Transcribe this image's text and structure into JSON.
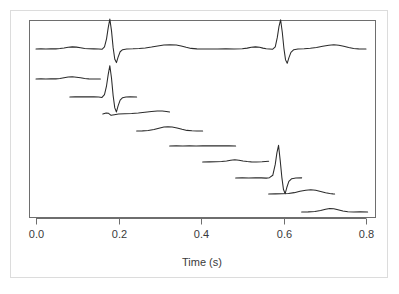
{
  "figure": {
    "background_color": "#ffffff",
    "outer_border_color": "#dcdcdc",
    "frame_color": "#6e6e6e",
    "trace_color": "#2b2b2b"
  },
  "chart_data": {
    "type": "line",
    "title": "",
    "subtitle": "",
    "xlabel": "Time (s)",
    "ylabel": "",
    "xlim": [
      -0.012,
      0.824
    ],
    "ylim": [
      0,
      1
    ],
    "grid": false,
    "legend": null,
    "xticks": [
      0.0,
      0.2,
      0.4,
      0.6,
      0.8
    ],
    "xticklabels": [
      "0.0",
      "0.2",
      "0.4",
      "0.6",
      "0.8"
    ],
    "yticks": [],
    "yticklabels": [],
    "series": [
      {
        "name": "full-ecg-strip",
        "row": 0,
        "x_start": 0.0,
        "x_end": 0.8,
        "baseline_y_px": 49,
        "points": [
          [
            0.0,
            0.0
          ],
          [
            0.012,
            0.004
          ],
          [
            0.024,
            0.002
          ],
          [
            0.036,
            0.006
          ],
          [
            0.048,
            0.004
          ],
          [
            0.058,
            0.012
          ],
          [
            0.068,
            0.03
          ],
          [
            0.078,
            0.052
          ],
          [
            0.088,
            0.062
          ],
          [
            0.098,
            0.055
          ],
          [
            0.108,
            0.036
          ],
          [
            0.118,
            0.016
          ],
          [
            0.128,
            0.006
          ],
          [
            0.14,
            0.004
          ],
          [
            0.152,
            0.0
          ],
          [
            0.16,
            -0.008
          ],
          [
            0.166,
            0.06
          ],
          [
            0.171,
            0.3
          ],
          [
            0.175,
            0.62
          ],
          [
            0.179,
            0.88
          ],
          [
            0.183,
            0.54
          ],
          [
            0.187,
            0.04
          ],
          [
            0.191,
            -0.3
          ],
          [
            0.195,
            -0.4
          ],
          [
            0.199,
            -0.24
          ],
          [
            0.204,
            -0.08
          ],
          [
            0.21,
            -0.02
          ],
          [
            0.22,
            0.0
          ],
          [
            0.235,
            0.006
          ],
          [
            0.25,
            0.016
          ],
          [
            0.265,
            0.03
          ],
          [
            0.28,
            0.056
          ],
          [
            0.295,
            0.088
          ],
          [
            0.31,
            0.115
          ],
          [
            0.325,
            0.126
          ],
          [
            0.34,
            0.118
          ],
          [
            0.352,
            0.09
          ],
          [
            0.364,
            0.05
          ],
          [
            0.376,
            0.018
          ],
          [
            0.39,
            0.004
          ],
          [
            0.405,
            0.0
          ],
          [
            0.42,
            0.002
          ],
          [
            0.44,
            0.0
          ],
          [
            0.46,
            0.004
          ],
          [
            0.48,
            0.002
          ],
          [
            0.5,
            0.008
          ],
          [
            0.512,
            0.026
          ],
          [
            0.522,
            0.05
          ],
          [
            0.532,
            0.062
          ],
          [
            0.542,
            0.05
          ],
          [
            0.55,
            0.026
          ],
          [
            0.558,
            0.008
          ],
          [
            0.566,
            0.0
          ],
          [
            0.574,
            -0.006
          ],
          [
            0.58,
            0.06
          ],
          [
            0.585,
            0.34
          ],
          [
            0.589,
            0.66
          ],
          [
            0.593,
            0.86
          ],
          [
            0.597,
            0.5
          ],
          [
            0.601,
            0.02
          ],
          [
            0.605,
            -0.32
          ],
          [
            0.609,
            -0.42
          ],
          [
            0.613,
            -0.26
          ],
          [
            0.618,
            -0.1
          ],
          [
            0.625,
            -0.02
          ],
          [
            0.635,
            0.0
          ],
          [
            0.65,
            0.006
          ],
          [
            0.665,
            0.02
          ],
          [
            0.68,
            0.045
          ],
          [
            0.695,
            0.08
          ],
          [
            0.71,
            0.11
          ],
          [
            0.722,
            0.122
          ],
          [
            0.734,
            0.112
          ],
          [
            0.746,
            0.082
          ],
          [
            0.758,
            0.042
          ],
          [
            0.77,
            0.014
          ],
          [
            0.782,
            0.004
          ],
          [
            0.792,
            0.002
          ],
          [
            0.8,
            0.0
          ]
        ]
      },
      {
        "name": "beat-segment-1",
        "row": 1,
        "x_start": 0.0,
        "x_end": 0.156,
        "baseline_y_px": 79,
        "points": [
          [
            0.0,
            0.0
          ],
          [
            0.012,
            0.004
          ],
          [
            0.024,
            0.0
          ],
          [
            0.036,
            0.006
          ],
          [
            0.048,
            0.004
          ],
          [
            0.058,
            0.014
          ],
          [
            0.068,
            0.034
          ],
          [
            0.078,
            0.056
          ],
          [
            0.088,
            0.064
          ],
          [
            0.098,
            0.054
          ],
          [
            0.108,
            0.034
          ],
          [
            0.118,
            0.014
          ],
          [
            0.128,
            0.004
          ],
          [
            0.14,
            0.002
          ],
          [
            0.156,
            0.0
          ]
        ]
      },
      {
        "name": "beat-segment-2",
        "row": 2,
        "x_start": 0.082,
        "x_end": 0.244,
        "baseline_y_px": 97,
        "points": [
          [
            0.082,
            0.0
          ],
          [
            0.095,
            0.006
          ],
          [
            0.11,
            0.004
          ],
          [
            0.125,
            0.008
          ],
          [
            0.14,
            0.004
          ],
          [
            0.152,
            0.0
          ],
          [
            0.16,
            -0.012
          ],
          [
            0.166,
            0.07
          ],
          [
            0.171,
            0.33
          ],
          [
            0.175,
            0.66
          ],
          [
            0.179,
            0.92
          ],
          [
            0.183,
            0.56
          ],
          [
            0.187,
            0.04
          ],
          [
            0.191,
            -0.32
          ],
          [
            0.195,
            -0.44
          ],
          [
            0.199,
            -0.26
          ],
          [
            0.204,
            -0.09
          ],
          [
            0.21,
            -0.02
          ],
          [
            0.218,
            0.0
          ],
          [
            0.228,
            0.004
          ],
          [
            0.244,
            0.002
          ]
        ]
      },
      {
        "name": "beat-segment-3",
        "row": 3,
        "x_start": 0.162,
        "x_end": 0.324,
        "baseline_y_px": 114,
        "points": [
          [
            0.162,
            0.0
          ],
          [
            0.17,
            0.03
          ],
          [
            0.176,
            0.02
          ],
          [
            0.182,
            -0.04
          ],
          [
            0.19,
            -0.02
          ],
          [
            0.2,
            0.0
          ],
          [
            0.215,
            0.006
          ],
          [
            0.232,
            0.016
          ],
          [
            0.248,
            0.03
          ],
          [
            0.264,
            0.05
          ],
          [
            0.28,
            0.072
          ],
          [
            0.294,
            0.086
          ],
          [
            0.306,
            0.086
          ],
          [
            0.316,
            0.072
          ],
          [
            0.324,
            0.058
          ]
        ]
      },
      {
        "name": "beat-segment-4",
        "row": 4,
        "x_start": 0.244,
        "x_end": 0.404,
        "baseline_y_px": 131,
        "points": [
          [
            0.244,
            0.0
          ],
          [
            0.258,
            0.004
          ],
          [
            0.272,
            0.014
          ],
          [
            0.286,
            0.042
          ],
          [
            0.298,
            0.082
          ],
          [
            0.31,
            0.115
          ],
          [
            0.32,
            0.126
          ],
          [
            0.33,
            0.118
          ],
          [
            0.342,
            0.09
          ],
          [
            0.354,
            0.05
          ],
          [
            0.366,
            0.018
          ],
          [
            0.378,
            0.006
          ],
          [
            0.39,
            0.002
          ],
          [
            0.404,
            0.0
          ]
        ]
      },
      {
        "name": "beat-segment-5",
        "row": 5,
        "x_start": 0.324,
        "x_end": 0.484,
        "baseline_y_px": 146,
        "points": [
          [
            0.324,
            0.0
          ],
          [
            0.34,
            0.004
          ],
          [
            0.356,
            0.002
          ],
          [
            0.372,
            0.006
          ],
          [
            0.388,
            0.002
          ],
          [
            0.404,
            0.006
          ],
          [
            0.42,
            0.004
          ],
          [
            0.436,
            0.008
          ],
          [
            0.452,
            0.004
          ],
          [
            0.468,
            0.006
          ],
          [
            0.484,
            0.002
          ]
        ]
      },
      {
        "name": "beat-segment-6",
        "row": 6,
        "x_start": 0.404,
        "x_end": 0.564,
        "baseline_y_px": 162,
        "points": [
          [
            0.404,
            0.0
          ],
          [
            0.42,
            0.004
          ],
          [
            0.436,
            0.006
          ],
          [
            0.45,
            0.012
          ],
          [
            0.462,
            0.03
          ],
          [
            0.472,
            0.054
          ],
          [
            0.482,
            0.066
          ],
          [
            0.492,
            0.054
          ],
          [
            0.502,
            0.03
          ],
          [
            0.512,
            0.012
          ],
          [
            0.522,
            0.004
          ],
          [
            0.534,
            0.0
          ],
          [
            0.548,
            0.006
          ],
          [
            0.556,
            0.012
          ],
          [
            0.564,
            0.02
          ]
        ]
      },
      {
        "name": "beat-segment-7",
        "row": 7,
        "x_start": 0.484,
        "x_end": 0.644,
        "baseline_y_px": 178,
        "points": [
          [
            0.484,
            0.0
          ],
          [
            0.5,
            0.004
          ],
          [
            0.516,
            0.002
          ],
          [
            0.532,
            0.006
          ],
          [
            0.546,
            0.004
          ],
          [
            0.558,
            -0.004
          ],
          [
            0.566,
            0.01
          ],
          [
            0.574,
            0.08
          ],
          [
            0.58,
            0.4
          ],
          [
            0.584,
            0.74
          ],
          [
            0.588,
            0.96
          ],
          [
            0.592,
            0.52
          ],
          [
            0.596,
            0.02
          ],
          [
            0.6,
            -0.34
          ],
          [
            0.604,
            -0.46
          ],
          [
            0.608,
            -0.28
          ],
          [
            0.613,
            -0.1
          ],
          [
            0.62,
            -0.02
          ],
          [
            0.63,
            0.0
          ],
          [
            0.644,
            0.004
          ]
        ]
      },
      {
        "name": "beat-segment-8",
        "row": 8,
        "x_start": 0.564,
        "x_end": 0.724,
        "baseline_y_px": 194,
        "points": [
          [
            0.564,
            0.0
          ],
          [
            0.58,
            0.004
          ],
          [
            0.596,
            0.006
          ],
          [
            0.612,
            0.016
          ],
          [
            0.626,
            0.04
          ],
          [
            0.64,
            0.078
          ],
          [
            0.654,
            0.112
          ],
          [
            0.666,
            0.124
          ],
          [
            0.678,
            0.11
          ],
          [
            0.69,
            0.074
          ],
          [
            0.702,
            0.036
          ],
          [
            0.712,
            0.012
          ],
          [
            0.72,
            0.004
          ],
          [
            0.724,
            0.002
          ]
        ]
      },
      {
        "name": "beat-segment-9",
        "row": 9,
        "x_start": 0.644,
        "x_end": 0.804,
        "baseline_y_px": 212,
        "points": [
          [
            0.644,
            0.0
          ],
          [
            0.66,
            0.004
          ],
          [
            0.676,
            0.014
          ],
          [
            0.69,
            0.042
          ],
          [
            0.702,
            0.082
          ],
          [
            0.712,
            0.104
          ],
          [
            0.722,
            0.096
          ],
          [
            0.732,
            0.064
          ],
          [
            0.744,
            0.028
          ],
          [
            0.756,
            0.008
          ],
          [
            0.77,
            0.002
          ],
          [
            0.786,
            0.004
          ],
          [
            0.804,
            0.002
          ]
        ]
      }
    ]
  },
  "axis": {
    "x_axis_label": "Time (s)",
    "tick_labels": [
      "0.0",
      "0.2",
      "0.4",
      "0.6",
      "0.8"
    ]
  }
}
